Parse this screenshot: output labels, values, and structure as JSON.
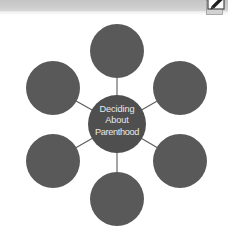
{
  "page": {
    "background_color": "#ffffff",
    "width": 228,
    "height": 249
  },
  "header": {
    "band_color": "#cccccc",
    "edit_icon": "edit-pencil-icon"
  },
  "diagram": {
    "type": "hub-and-spoke",
    "title": "Deciding About Parenthood",
    "node_color": "#595959",
    "hub_color": "#4f4f4f",
    "connector_color": "#595959",
    "label_color": "#e9e9e9",
    "hub": {
      "label_lines": [
        "Deciding",
        "About",
        "Parenthood"
      ],
      "cx": 117,
      "cy": 124,
      "r": 29
    },
    "satellites": [
      {
        "id": "node-top",
        "label": "",
        "cx": 117,
        "cy": 51,
        "r": 27
      },
      {
        "id": "node-upper-right",
        "label": "",
        "cx": 180,
        "cy": 88,
        "r": 27
      },
      {
        "id": "node-lower-right",
        "label": "",
        "cx": 180,
        "cy": 161,
        "r": 27
      },
      {
        "id": "node-bottom",
        "label": "",
        "cx": 117,
        "cy": 199,
        "r": 27
      },
      {
        "id": "node-lower-left",
        "label": "",
        "cx": 53,
        "cy": 161,
        "r": 27
      },
      {
        "id": "node-upper-left",
        "label": "",
        "cx": 53,
        "cy": 88,
        "r": 27
      }
    ]
  }
}
